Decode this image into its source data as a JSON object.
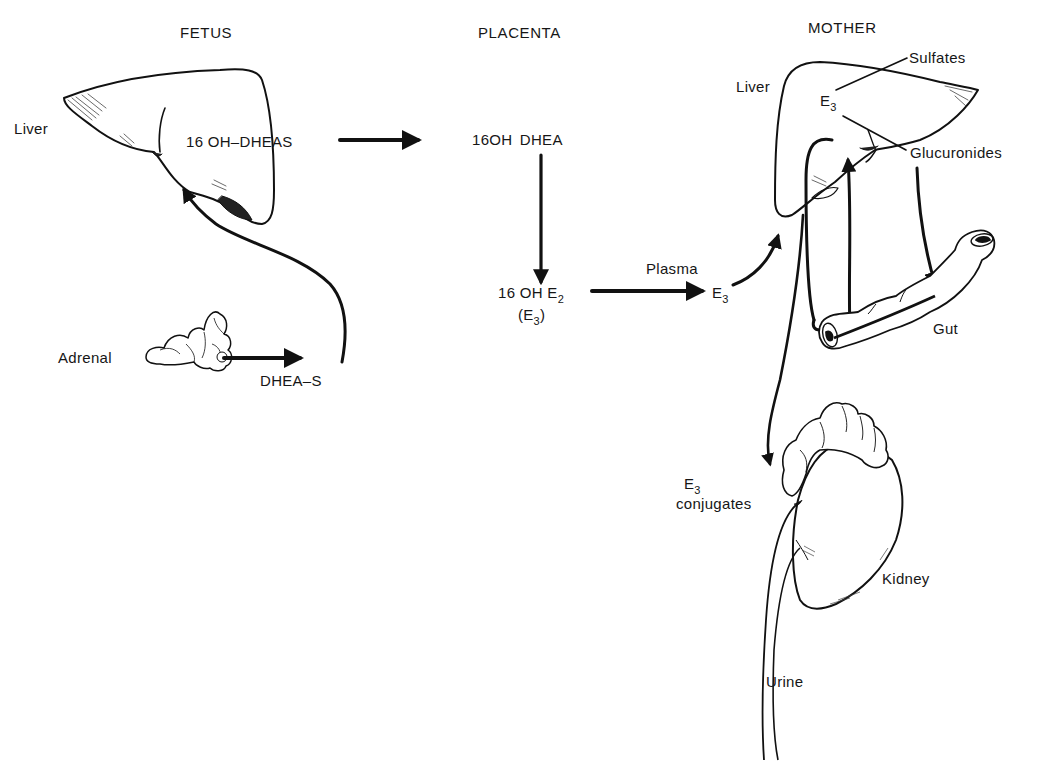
{
  "diagram": {
    "columns": [
      {
        "id": "fetus",
        "label": "FETUS"
      },
      {
        "id": "placenta",
        "label": "PLACENTA"
      },
      {
        "id": "mother",
        "label": "MOTHER"
      }
    ],
    "fetus": {
      "liver_label": "Liver",
      "liver_metabolite": "16 OH–DHEAS",
      "adrenal_label": "Adrenal",
      "adrenal_product": "DHEA–S"
    },
    "placenta": {
      "precursor": "16OH  DHEA",
      "product_main": "16 OH E",
      "product_main_sub": "2",
      "product_alt_open": "(E",
      "product_alt_sub": "3",
      "product_alt_close": ")"
    },
    "mother": {
      "plasma_label": "Plasma",
      "plasma_e3": "E",
      "plasma_e3_sub": "3",
      "liver_label": "Liver",
      "liver_e3": "E",
      "liver_e3_sub": "3",
      "sulfates_label": "Sulfates",
      "glucuronides_label": "Glucuronides",
      "gut_label": "Gut",
      "conjugates_e3": "E",
      "conjugates_e3_sub": "3",
      "conjugates_label": "conjugates",
      "kidney_label": "Kidney",
      "urine_label": "Urine"
    },
    "flows": [
      {
        "from": "fetal-adrenal",
        "to": "DHEA-S"
      },
      {
        "from": "DHEA-S",
        "to": "fetal-liver"
      },
      {
        "from": "16 OH-DHEAS",
        "to": "16OH DHEA (placenta)"
      },
      {
        "from": "16OH DHEA",
        "to": "16 OH E2 (E3)"
      },
      {
        "from": "16 OH E2",
        "to": "Plasma E3"
      },
      {
        "from": "Plasma E3",
        "to": "maternal-liver"
      },
      {
        "from": "maternal-liver E3",
        "to": "Sulfates / Glucuronides"
      },
      {
        "from": "Glucuronides",
        "to": "Gut"
      },
      {
        "from": "Gut",
        "to": "maternal-liver (enterohepatic)"
      },
      {
        "from": "maternal-liver",
        "to": "Kidney (E3 conjugates)"
      },
      {
        "from": "Kidney",
        "to": "Urine"
      }
    ],
    "colors": {
      "ink": "#111111",
      "paper": "#ffffff",
      "hatch": "#333333"
    }
  }
}
